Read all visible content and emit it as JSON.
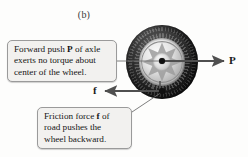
{
  "figure": {
    "panel_label": "(b)",
    "background_color": "#fdfdfc"
  },
  "wheel": {
    "name": "car wheel with tire and alloy rim",
    "tire_color": "#1b1b1b",
    "rim_color": "#d2d2d2",
    "center_marker": "axle center point",
    "contact_marker": "road contact point"
  },
  "forces": [
    {
      "symbol": "P",
      "name": "forward push of axle",
      "direction": "right",
      "applied_at": "center of wheel",
      "color": "#4f4f4f"
    },
    {
      "symbol": "f",
      "name": "friction force of road",
      "direction": "left",
      "applied_at": "bottom contact point",
      "color": "#4f4f4f"
    }
  ],
  "callouts": {
    "push": {
      "line1_a": "Forward push ",
      "line1_bold": "P",
      "line1_b": " of axle",
      "line2": "exerts no torque about",
      "line3": "center of the wheel."
    },
    "friction": {
      "line1_a": "Friction force ",
      "line1_bold": "f",
      "line1_b": " of",
      "line2": "road pushes the",
      "line3": "wheel backward."
    }
  },
  "leader_lines": [
    {
      "name": "push-callout-leader",
      "from": "callout right edge",
      "to": "wheel center"
    },
    {
      "name": "friction-callout-leader",
      "from": "callout top-right",
      "to": "contact point"
    }
  ]
}
